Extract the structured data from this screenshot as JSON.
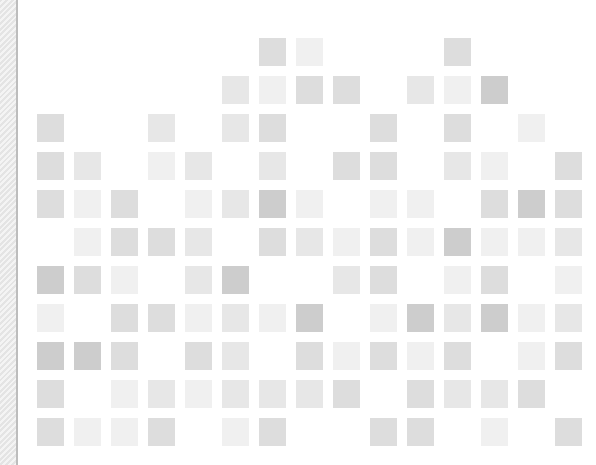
{
  "grid": {
    "columns": 15,
    "rows": 11,
    "origin_x": 37,
    "origin_y": 38,
    "pitch_x": 37,
    "pitch_y": 38,
    "cell_width": 27,
    "cell_height": 28,
    "palette": {
      "1": "#f0f0f0",
      "2": "#e7e7e7",
      "3": "#dddddd",
      "4": "#cdcdcd"
    },
    "cells": [
      {
        "row": 1,
        "col": 7,
        "shade": 3
      },
      {
        "row": 1,
        "col": 8,
        "shade": 1
      },
      {
        "row": 1,
        "col": 12,
        "shade": 3
      },
      {
        "row": 2,
        "col": 6,
        "shade": 2
      },
      {
        "row": 2,
        "col": 7,
        "shade": 1
      },
      {
        "row": 2,
        "col": 8,
        "shade": 3
      },
      {
        "row": 2,
        "col": 9,
        "shade": 3
      },
      {
        "row": 2,
        "col": 11,
        "shade": 2
      },
      {
        "row": 2,
        "col": 12,
        "shade": 1
      },
      {
        "row": 2,
        "col": 13,
        "shade": 4
      },
      {
        "row": 3,
        "col": 1,
        "shade": 3
      },
      {
        "row": 3,
        "col": 4,
        "shade": 2
      },
      {
        "row": 3,
        "col": 6,
        "shade": 2
      },
      {
        "row": 3,
        "col": 7,
        "shade": 3
      },
      {
        "row": 3,
        "col": 10,
        "shade": 3
      },
      {
        "row": 3,
        "col": 12,
        "shade": 3
      },
      {
        "row": 3,
        "col": 14,
        "shade": 1
      },
      {
        "row": 4,
        "col": 1,
        "shade": 3
      },
      {
        "row": 4,
        "col": 2,
        "shade": 2
      },
      {
        "row": 4,
        "col": 4,
        "shade": 1
      },
      {
        "row": 4,
        "col": 5,
        "shade": 2
      },
      {
        "row": 4,
        "col": 7,
        "shade": 2
      },
      {
        "row": 4,
        "col": 9,
        "shade": 3
      },
      {
        "row": 4,
        "col": 10,
        "shade": 3
      },
      {
        "row": 4,
        "col": 12,
        "shade": 2
      },
      {
        "row": 4,
        "col": 13,
        "shade": 1
      },
      {
        "row": 4,
        "col": 15,
        "shade": 3
      },
      {
        "row": 5,
        "col": 1,
        "shade": 3
      },
      {
        "row": 5,
        "col": 2,
        "shade": 1
      },
      {
        "row": 5,
        "col": 3,
        "shade": 3
      },
      {
        "row": 5,
        "col": 5,
        "shade": 1
      },
      {
        "row": 5,
        "col": 6,
        "shade": 2
      },
      {
        "row": 5,
        "col": 7,
        "shade": 4
      },
      {
        "row": 5,
        "col": 8,
        "shade": 1
      },
      {
        "row": 5,
        "col": 10,
        "shade": 1
      },
      {
        "row": 5,
        "col": 11,
        "shade": 1
      },
      {
        "row": 5,
        "col": 13,
        "shade": 3
      },
      {
        "row": 5,
        "col": 14,
        "shade": 4
      },
      {
        "row": 5,
        "col": 15,
        "shade": 3
      },
      {
        "row": 6,
        "col": 2,
        "shade": 1
      },
      {
        "row": 6,
        "col": 3,
        "shade": 3
      },
      {
        "row": 6,
        "col": 4,
        "shade": 3
      },
      {
        "row": 6,
        "col": 5,
        "shade": 2
      },
      {
        "row": 6,
        "col": 7,
        "shade": 3
      },
      {
        "row": 6,
        "col": 8,
        "shade": 2
      },
      {
        "row": 6,
        "col": 9,
        "shade": 1
      },
      {
        "row": 6,
        "col": 10,
        "shade": 3
      },
      {
        "row": 6,
        "col": 11,
        "shade": 1
      },
      {
        "row": 6,
        "col": 12,
        "shade": 4
      },
      {
        "row": 6,
        "col": 13,
        "shade": 1
      },
      {
        "row": 6,
        "col": 14,
        "shade": 1
      },
      {
        "row": 6,
        "col": 15,
        "shade": 2
      },
      {
        "row": 7,
        "col": 1,
        "shade": 4
      },
      {
        "row": 7,
        "col": 2,
        "shade": 3
      },
      {
        "row": 7,
        "col": 3,
        "shade": 1
      },
      {
        "row": 7,
        "col": 5,
        "shade": 2
      },
      {
        "row": 7,
        "col": 6,
        "shade": 4
      },
      {
        "row": 7,
        "col": 9,
        "shade": 2
      },
      {
        "row": 7,
        "col": 10,
        "shade": 3
      },
      {
        "row": 7,
        "col": 12,
        "shade": 1
      },
      {
        "row": 7,
        "col": 13,
        "shade": 3
      },
      {
        "row": 7,
        "col": 15,
        "shade": 1
      },
      {
        "row": 8,
        "col": 1,
        "shade": 1
      },
      {
        "row": 8,
        "col": 3,
        "shade": 3
      },
      {
        "row": 8,
        "col": 4,
        "shade": 3
      },
      {
        "row": 8,
        "col": 5,
        "shade": 1
      },
      {
        "row": 8,
        "col": 6,
        "shade": 2
      },
      {
        "row": 8,
        "col": 7,
        "shade": 1
      },
      {
        "row": 8,
        "col": 8,
        "shade": 4
      },
      {
        "row": 8,
        "col": 10,
        "shade": 1
      },
      {
        "row": 8,
        "col": 11,
        "shade": 4
      },
      {
        "row": 8,
        "col": 12,
        "shade": 2
      },
      {
        "row": 8,
        "col": 13,
        "shade": 4
      },
      {
        "row": 8,
        "col": 14,
        "shade": 1
      },
      {
        "row": 8,
        "col": 15,
        "shade": 2
      },
      {
        "row": 9,
        "col": 1,
        "shade": 4
      },
      {
        "row": 9,
        "col": 2,
        "shade": 4
      },
      {
        "row": 9,
        "col": 3,
        "shade": 3
      },
      {
        "row": 9,
        "col": 5,
        "shade": 3
      },
      {
        "row": 9,
        "col": 6,
        "shade": 2
      },
      {
        "row": 9,
        "col": 8,
        "shade": 3
      },
      {
        "row": 9,
        "col": 9,
        "shade": 1
      },
      {
        "row": 9,
        "col": 10,
        "shade": 3
      },
      {
        "row": 9,
        "col": 11,
        "shade": 1
      },
      {
        "row": 9,
        "col": 12,
        "shade": 3
      },
      {
        "row": 9,
        "col": 14,
        "shade": 1
      },
      {
        "row": 9,
        "col": 15,
        "shade": 3
      },
      {
        "row": 10,
        "col": 1,
        "shade": 3
      },
      {
        "row": 10,
        "col": 3,
        "shade": 1
      },
      {
        "row": 10,
        "col": 4,
        "shade": 2
      },
      {
        "row": 10,
        "col": 5,
        "shade": 1
      },
      {
        "row": 10,
        "col": 6,
        "shade": 2
      },
      {
        "row": 10,
        "col": 7,
        "shade": 2
      },
      {
        "row": 10,
        "col": 8,
        "shade": 2
      },
      {
        "row": 10,
        "col": 9,
        "shade": 3
      },
      {
        "row": 10,
        "col": 11,
        "shade": 3
      },
      {
        "row": 10,
        "col": 12,
        "shade": 2
      },
      {
        "row": 10,
        "col": 13,
        "shade": 2
      },
      {
        "row": 10,
        "col": 14,
        "shade": 3
      },
      {
        "row": 11,
        "col": 1,
        "shade": 3
      },
      {
        "row": 11,
        "col": 2,
        "shade": 1
      },
      {
        "row": 11,
        "col": 3,
        "shade": 1
      },
      {
        "row": 11,
        "col": 4,
        "shade": 3
      },
      {
        "row": 11,
        "col": 6,
        "shade": 1
      },
      {
        "row": 11,
        "col": 7,
        "shade": 3
      },
      {
        "row": 11,
        "col": 10,
        "shade": 3
      },
      {
        "row": 11,
        "col": 11,
        "shade": 3
      },
      {
        "row": 11,
        "col": 13,
        "shade": 1
      },
      {
        "row": 11,
        "col": 15,
        "shade": 3
      }
    ]
  }
}
